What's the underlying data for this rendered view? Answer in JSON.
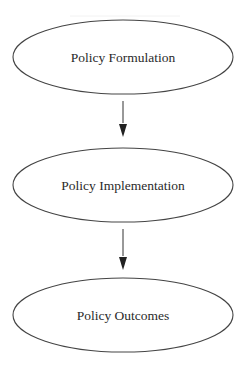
{
  "diagram": {
    "type": "flowchart",
    "direction": "top-to-bottom",
    "nodes": [
      {
        "id": "formulation",
        "label": "Policy Formulation",
        "shape": "ellipse"
      },
      {
        "id": "implementation",
        "label": "Policy Implementation",
        "shape": "ellipse"
      },
      {
        "id": "outcomes",
        "label": "Policy Outcomes",
        "shape": "ellipse"
      }
    ],
    "edges": [
      {
        "from": "formulation",
        "to": "implementation"
      },
      {
        "from": "implementation",
        "to": "outcomes"
      }
    ],
    "colors": {
      "stroke": "#444444",
      "text": "#2a2a2a",
      "background": "#ffffff"
    }
  }
}
